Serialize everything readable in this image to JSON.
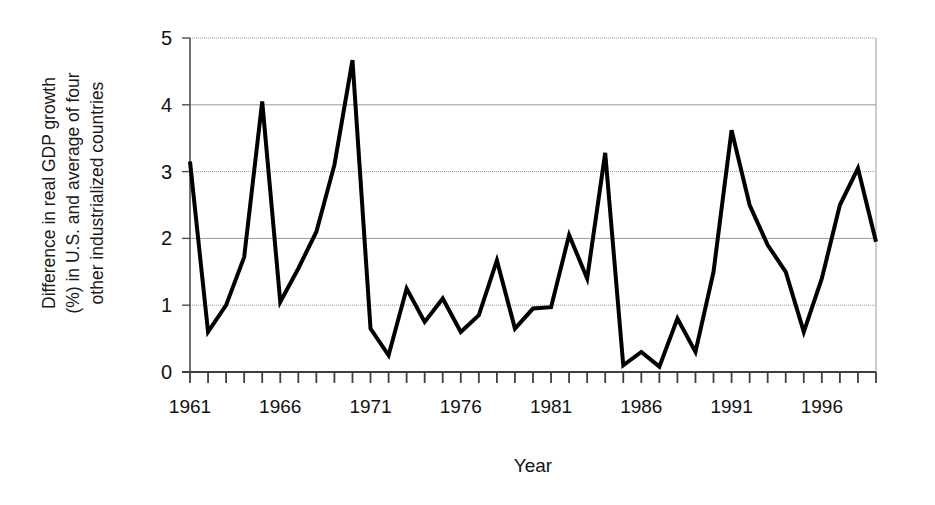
{
  "chart_data": {
    "type": "line",
    "title": "",
    "xlabel": "Year",
    "ylabel": "Difference in real GDP growth (%) in U.S. and average of four other industrialized countries",
    "ylabel_lines": [
      "Difference in real GDP growth",
      "(%) in U.S. and average of four",
      "other industrialized countries"
    ],
    "ylim": [
      0,
      5
    ],
    "xlim": [
      1961,
      1999
    ],
    "ytick_labels": [
      "0",
      "1",
      "2",
      "3",
      "4",
      "5"
    ],
    "ytick_values": [
      0,
      1,
      2,
      3,
      4,
      5
    ],
    "xtick_labels": [
      "1961",
      "1966",
      "1971",
      "1976",
      "1981",
      "1986",
      "1991",
      "1996"
    ],
    "xtick_values": [
      1961,
      1966,
      1971,
      1976,
      1981,
      1986,
      1991,
      1996
    ],
    "minor_xticks_every": 1,
    "grid": "horizontal",
    "legend": "none",
    "line_color": "#000000",
    "line_width": 4,
    "grid_color": "#9a9a9a",
    "axis_color": "#4d4d4d",
    "x": [
      1961,
      1962,
      1963,
      1964,
      1965,
      1966,
      1967,
      1968,
      1969,
      1970,
      1971,
      1972,
      1973,
      1974,
      1975,
      1976,
      1977,
      1978,
      1979,
      1980,
      1981,
      1982,
      1983,
      1984,
      1985,
      1986,
      1987,
      1988,
      1989,
      1990,
      1991,
      1992,
      1993,
      1994,
      1995,
      1996,
      1997,
      1998,
      1999
    ],
    "values": [
      3.15,
      0.6,
      1.0,
      1.72,
      4.05,
      1.05,
      1.55,
      2.1,
      3.1,
      4.67,
      0.65,
      0.25,
      1.25,
      0.75,
      1.1,
      0.6,
      0.85,
      1.67,
      0.65,
      0.95,
      0.97,
      2.05,
      1.4,
      3.28,
      0.1,
      0.3,
      0.08,
      0.8,
      0.3,
      1.5,
      3.62,
      2.5,
      1.9,
      1.5,
      0.6,
      1.4,
      2.5,
      3.05,
      1.95
    ]
  }
}
